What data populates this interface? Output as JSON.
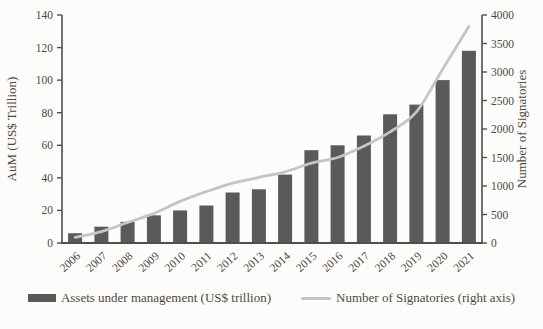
{
  "chart_data": {
    "type": "bar",
    "title": "",
    "categories": [
      "2006",
      "2007",
      "2008",
      "2009",
      "2010",
      "2011",
      "2012",
      "2013",
      "2014",
      "2015",
      "2016",
      "2017",
      "2018",
      "2019",
      "2020",
      "2021"
    ],
    "series": [
      {
        "name": "Assets under management (US$ trillion)",
        "type": "bar",
        "axis": "left",
        "color": "#5a5a5a",
        "values": [
          6,
          10,
          13,
          17,
          20,
          23,
          31,
          33,
          42,
          57,
          60,
          66,
          79,
          85,
          100,
          118
        ]
      },
      {
        "name": "Number of Signatories (right axis)",
        "type": "line",
        "axis": "right",
        "color": "#c5c5c5",
        "values": [
          100,
          200,
          360,
          520,
          730,
          900,
          1050,
          1150,
          1250,
          1400,
          1500,
          1700,
          1950,
          2300,
          3050,
          3800
        ]
      }
    ],
    "left_axis": {
      "label": "AuM (US$ Trillion)",
      "min": 0,
      "max": 140,
      "step": 20,
      "ticks": [
        0,
        20,
        40,
        60,
        80,
        100,
        120,
        140
      ]
    },
    "right_axis": {
      "label": "Number of Signatories",
      "min": 0,
      "max": 4000,
      "step": 500,
      "ticks": [
        0,
        500,
        1000,
        1500,
        2000,
        2500,
        3000,
        3500,
        4000
      ]
    },
    "grid": false,
    "legend_position": "bottom"
  },
  "legend": {
    "items": [
      {
        "label": "Assets under management (US$ trillion)",
        "swatch": "bar",
        "color": "#5a5a5a"
      },
      {
        "label": "Number of Signatories (right axis)",
        "swatch": "line",
        "color": "#c5c5c5"
      }
    ]
  },
  "colors": {
    "background": "#fcfcfa",
    "axis": "#4f4f4f",
    "text": "#52493c",
    "bar": "#5a5a5a",
    "line": "#c5c5c5"
  }
}
